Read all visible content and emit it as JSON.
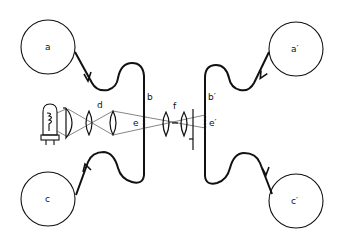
{
  "diagram": {
    "labels": {
      "a": "a",
      "a_prime": "a′",
      "b": "b",
      "b_prime": "b′",
      "c": "c",
      "c_prime": "c′",
      "d": "d",
      "e": "e",
      "e_prime": "e′",
      "f": "f"
    },
    "colors": {
      "stroke": "#111111",
      "background": "#ffffff"
    }
  }
}
